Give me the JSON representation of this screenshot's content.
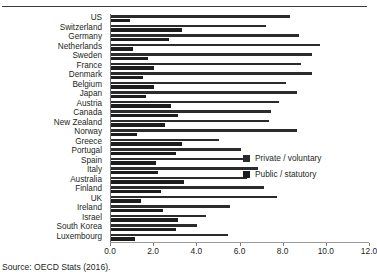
{
  "figure": {
    "source_note": "Source: OECD Stats (2016)."
  },
  "legend": {
    "position": "inside-right",
    "items": [
      {
        "label": "Private / voluntary",
        "color": "#2b2b2b",
        "swatch": "legend-swatch-private"
      },
      {
        "label": "Public / statutory",
        "color": "#1d1d1d",
        "swatch": "legend-swatch-public"
      }
    ]
  },
  "axis": {
    "ticks": [
      "0.0",
      "2.0",
      "4.0",
      "6.0",
      "8.0",
      "10.0",
      "12.0"
    ],
    "tick_values": [
      0,
      2,
      4,
      6,
      8,
      10,
      12
    ]
  },
  "chart_data": {
    "type": "bar",
    "orientation": "horizontal",
    "title": "",
    "subtitle": "",
    "xlabel": "",
    "ylabel": "",
    "xlim": [
      0,
      12
    ],
    "ylim": null,
    "grid": false,
    "legend_position": "inside-right",
    "categories": [
      "US",
      "Switzerland",
      "Germany",
      "Netherlands",
      "Sweden",
      "France",
      "Denmark",
      "Belgium",
      "Japan",
      "Austria",
      "Canada",
      "New Zealand",
      "Norway",
      "Greece",
      "Portugal",
      "Spain",
      "Italy",
      "Australia",
      "Finland",
      "UK",
      "Ireland",
      "Israel",
      "South Korea",
      "Luxembourg"
    ],
    "series": [
      {
        "name": "Private / voluntary",
        "color": "#2b2b2b",
        "values": [
          8.3,
          7.2,
          8.7,
          9.7,
          9.3,
          8.8,
          9.3,
          8.1,
          8.6,
          7.8,
          7.4,
          7.3,
          8.6,
          5.0,
          6.0,
          6.4,
          6.8,
          6.3,
          7.1,
          7.7,
          5.5,
          4.4,
          4.0,
          5.4
        ],
        "values_note": "Length of upper (private/voluntary) bar per country in percent of GDP"
      },
      {
        "name": "Public / statutory",
        "color": "#1d1d1d",
        "values": [
          0.9,
          3.3,
          2.7,
          1.0,
          1.7,
          2.0,
          1.5,
          2.0,
          1.6,
          2.8,
          3.1,
          2.5,
          1.2,
          3.3,
          3.0,
          2.1,
          2.2,
          3.4,
          2.3,
          1.4,
          2.4,
          3.1,
          3.0,
          1.1
        ],
        "values_note": "Length of lower (public/statutory) bar per country in percent of GDP"
      }
    ]
  }
}
